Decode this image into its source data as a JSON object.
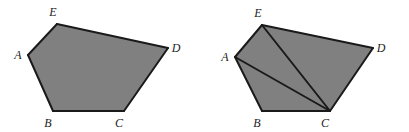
{
  "diagram": {
    "background_color": "#ffffff",
    "fill_color": "#808080",
    "stroke_color": "#1a1a1a",
    "label_color": "#1c1c1c",
    "stroke_width": 2,
    "diagonal_stroke_width": 2,
    "figures": [
      {
        "id": "left-pentagon",
        "name": "pentagon-abcde-plain",
        "caption": "",
        "polygon_points": "28,55 57,24 168,48 124,111 53,111",
        "vertices": [
          {
            "id": "A",
            "label": "A",
            "x": 28,
            "y": 55,
            "label_x": 18,
            "label_y": 59
          },
          {
            "id": "E",
            "label": "E",
            "x": 57,
            "y": 24,
            "label_x": 53,
            "label_y": 16
          },
          {
            "id": "D",
            "label": "D",
            "x": 168,
            "y": 48,
            "label_x": 176,
            "label_y": 52
          },
          {
            "id": "C",
            "label": "C",
            "x": 124,
            "y": 111,
            "label_x": 119,
            "label_y": 127
          },
          {
            "id": "B",
            "label": "B",
            "x": 53,
            "y": 111,
            "label_x": 48,
            "label_y": 127
          }
        ],
        "edges": [
          {
            "id": "AE",
            "from": "A",
            "to": "E",
            "x1": 28,
            "y1": 55,
            "x2": 57,
            "y2": 24
          },
          {
            "id": "ED",
            "from": "E",
            "to": "D",
            "x1": 57,
            "y1": 24,
            "x2": 168,
            "y2": 48
          },
          {
            "id": "DC",
            "from": "D",
            "to": "C",
            "x1": 168,
            "y1": 48,
            "x2": 124,
            "y2": 111
          },
          {
            "id": "CB",
            "from": "C",
            "to": "B",
            "x1": 124,
            "y1": 111,
            "x2": 53,
            "y2": 111
          },
          {
            "id": "BA",
            "from": "B",
            "to": "A",
            "x1": 53,
            "y1": 111,
            "x2": 28,
            "y2": 55
          }
        ],
        "diagonals": []
      },
      {
        "id": "right-pentagon",
        "name": "pentagon-abcde-triangulated",
        "caption": "",
        "polygon_points": "235,57 262,25 373,48 330,111 262,111",
        "vertices": [
          {
            "id": "A",
            "label": "A",
            "x": 235,
            "y": 57,
            "label_x": 225,
            "label_y": 61
          },
          {
            "id": "E",
            "label": "E",
            "x": 262,
            "y": 25,
            "label_x": 258,
            "label_y": 17
          },
          {
            "id": "D",
            "label": "D",
            "x": 373,
            "y": 48,
            "label_x": 381,
            "label_y": 52
          },
          {
            "id": "C",
            "label": "C",
            "x": 330,
            "y": 111,
            "label_x": 325,
            "label_y": 127
          },
          {
            "id": "B",
            "label": "B",
            "x": 262,
            "y": 111,
            "label_x": 257,
            "label_y": 127
          }
        ],
        "edges": [
          {
            "id": "AE",
            "from": "A",
            "to": "E",
            "x1": 235,
            "y1": 57,
            "x2": 262,
            "y2": 25
          },
          {
            "id": "ED",
            "from": "E",
            "to": "D",
            "x1": 262,
            "y1": 25,
            "x2": 373,
            "y2": 48
          },
          {
            "id": "DC",
            "from": "D",
            "to": "C",
            "x1": 373,
            "y1": 48,
            "x2": 330,
            "y2": 111
          },
          {
            "id": "CB",
            "from": "C",
            "to": "B",
            "x1": 330,
            "y1": 111,
            "x2": 262,
            "y2": 111
          },
          {
            "id": "BA",
            "from": "B",
            "to": "A",
            "x1": 262,
            "y1": 111,
            "x2": 235,
            "y2": 57
          }
        ],
        "diagonals": [
          {
            "id": "EC",
            "from": "E",
            "to": "C",
            "x1": 262,
            "y1": 25,
            "x2": 330,
            "y2": 111
          },
          {
            "id": "AC",
            "from": "A",
            "to": "C",
            "x1": 235,
            "y1": 57,
            "x2": 330,
            "y2": 111
          }
        ]
      }
    ]
  }
}
